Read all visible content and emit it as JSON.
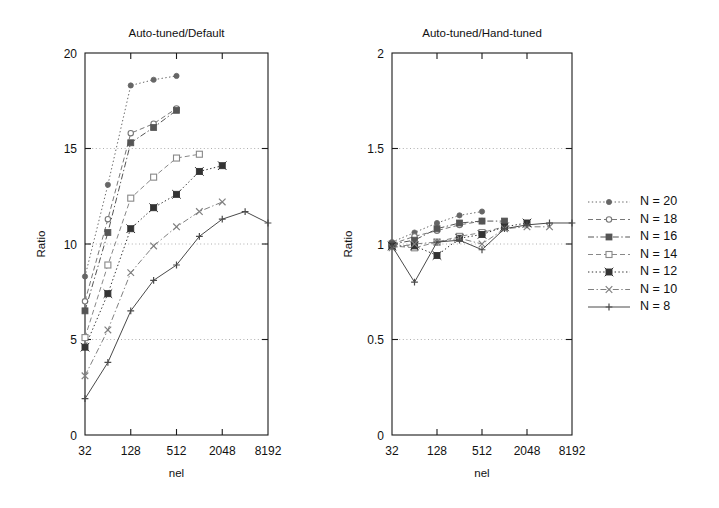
{
  "figure": {
    "width": 719,
    "height": 508,
    "background": "#ffffff",
    "ink": "#1a1a1a"
  },
  "legend": {
    "name": "series-legend",
    "position": "right",
    "entries": [
      {
        "label": "N = 20",
        "n": 20,
        "marker": "filled-circle",
        "line": "dotted",
        "color": "#666666"
      },
      {
        "label": "N = 18",
        "n": 18,
        "marker": "open-circle",
        "line": "dashed",
        "color": "#777777"
      },
      {
        "label": "N = 16",
        "n": 16,
        "marker": "filled-square",
        "line": "dash-dot",
        "color": "#555555"
      },
      {
        "label": "N = 14",
        "n": 14,
        "marker": "open-square",
        "line": "dashed",
        "color": "#888888"
      },
      {
        "label": "N = 12",
        "n": 12,
        "marker": "filled-square-x",
        "line": "dotted",
        "color": "#333333"
      },
      {
        "label": "N = 10",
        "n": 10,
        "marker": "cross-x",
        "line": "dash-dot",
        "color": "#808080"
      },
      {
        "label": "N =  8",
        "n": 8,
        "marker": "plus",
        "line": "solid",
        "color": "#4a4a4a"
      }
    ]
  },
  "chart_data": [
    {
      "id": "auto-tuned-over-default",
      "type": "line",
      "title": "Auto-tuned/Default",
      "xlabel": "nel",
      "ylabel": "Ratio",
      "xscale": "log4",
      "xlim": [
        32,
        8192
      ],
      "ylim": [
        0,
        20
      ],
      "xticks": [
        32,
        128,
        512,
        2048,
        8192
      ],
      "xticklabels": [
        "32",
        "128",
        "512",
        "2048",
        "8192"
      ],
      "yticks": [
        0,
        5,
        10,
        15,
        20
      ],
      "yticklabels": [
        "0",
        "5",
        "10",
        "15",
        "20"
      ],
      "grid": "horizontal-dotted-at-5-10-15",
      "legend_position": "outside-right",
      "x": [
        32,
        64,
        128,
        256,
        512,
        1024,
        2048,
        4096,
        8192
      ],
      "series": [
        {
          "name": "N = 20",
          "marker": "filled-circle",
          "line": "dotted",
          "color": "#666666",
          "values": [
            8.3,
            13.1,
            18.3,
            18.6,
            18.8,
            null,
            null,
            null,
            null
          ]
        },
        {
          "name": "N = 18",
          "marker": "open-circle",
          "line": "dashed",
          "color": "#777777",
          "values": [
            7.0,
            11.3,
            15.8,
            16.3,
            17.1,
            null,
            null,
            null,
            null
          ]
        },
        {
          "name": "N = 16",
          "marker": "filled-square",
          "line": "dash-dot",
          "color": "#555555",
          "values": [
            6.5,
            10.6,
            15.3,
            16.1,
            17.0,
            null,
            null,
            null,
            null
          ]
        },
        {
          "name": "N = 14",
          "marker": "open-square",
          "line": "dashed",
          "color": "#888888",
          "values": [
            5.1,
            8.9,
            12.4,
            13.5,
            14.5,
            14.7,
            null,
            null,
            null
          ]
        },
        {
          "name": "N = 12",
          "marker": "filled-square-x",
          "line": "dotted",
          "color": "#333333",
          "values": [
            4.6,
            7.4,
            10.8,
            11.9,
            12.6,
            13.8,
            14.1,
            null,
            null
          ]
        },
        {
          "name": "N = 10",
          "marker": "cross-x",
          "line": "dash-dot",
          "color": "#808080",
          "values": [
            3.1,
            5.5,
            8.5,
            9.9,
            10.9,
            11.7,
            12.2,
            null,
            null
          ]
        },
        {
          "name": "N =  8",
          "marker": "plus",
          "line": "solid",
          "color": "#4a4a4a",
          "values": [
            1.9,
            3.8,
            6.5,
            8.1,
            8.9,
            10.4,
            11.3,
            11.7,
            11.1
          ]
        }
      ]
    },
    {
      "id": "auto-tuned-over-hand-tuned",
      "type": "line",
      "title": "Auto-tuned/Hand-tuned",
      "xlabel": "nel",
      "ylabel": "Ratio",
      "xscale": "log4",
      "xlim": [
        32,
        8192
      ],
      "ylim": [
        0,
        2
      ],
      "xticks": [
        32,
        128,
        512,
        2048,
        8192
      ],
      "xticklabels": [
        "32",
        "128",
        "512",
        "2048",
        "8192"
      ],
      "yticks": [
        0,
        0.5,
        1,
        1.5,
        2
      ],
      "yticklabels": [
        "0",
        "0.5",
        "1",
        "1.5",
        "2"
      ],
      "grid": "horizontal-dotted-at-0.5-1-1.5",
      "legend_position": "outside-right",
      "x": [
        32,
        64,
        128,
        256,
        512,
        1024,
        2048,
        4096,
        8192
      ],
      "series": [
        {
          "name": "N = 20",
          "marker": "filled-circle",
          "line": "dotted",
          "color": "#666666",
          "values": [
            1.01,
            1.06,
            1.11,
            1.15,
            1.17,
            null,
            null,
            null,
            null
          ]
        },
        {
          "name": "N = 18",
          "marker": "open-circle",
          "line": "dashed",
          "color": "#777777",
          "values": [
            1.0,
            1.04,
            1.07,
            1.1,
            1.12,
            null,
            null,
            null,
            null
          ]
        },
        {
          "name": "N = 16",
          "marker": "filled-square",
          "line": "dash-dot",
          "color": "#555555",
          "values": [
            1.0,
            1.02,
            1.08,
            1.11,
            1.12,
            1.12,
            null,
            null,
            null
          ]
        },
        {
          "name": "N = 14",
          "marker": "open-square",
          "line": "dashed",
          "color": "#888888",
          "values": [
            0.99,
            0.98,
            1.01,
            1.04,
            1.06,
            1.09,
            null,
            null,
            null
          ]
        },
        {
          "name": "N = 12",
          "marker": "filled-square-x",
          "line": "dotted",
          "color": "#333333",
          "values": [
            0.99,
            0.99,
            0.94,
            1.03,
            1.05,
            1.09,
            1.11,
            null,
            null
          ]
        },
        {
          "name": "N = 10",
          "marker": "cross-x",
          "line": "dash-dot",
          "color": "#808080",
          "values": [
            0.98,
            1.0,
            1.01,
            1.03,
            1.0,
            1.08,
            1.09,
            1.09,
            null
          ]
        },
        {
          "name": "N =  8",
          "marker": "plus",
          "line": "solid",
          "color": "#4a4a4a",
          "values": [
            0.99,
            0.8,
            1.01,
            1.02,
            0.97,
            1.08,
            1.1,
            1.11,
            1.11
          ]
        }
      ]
    }
  ]
}
